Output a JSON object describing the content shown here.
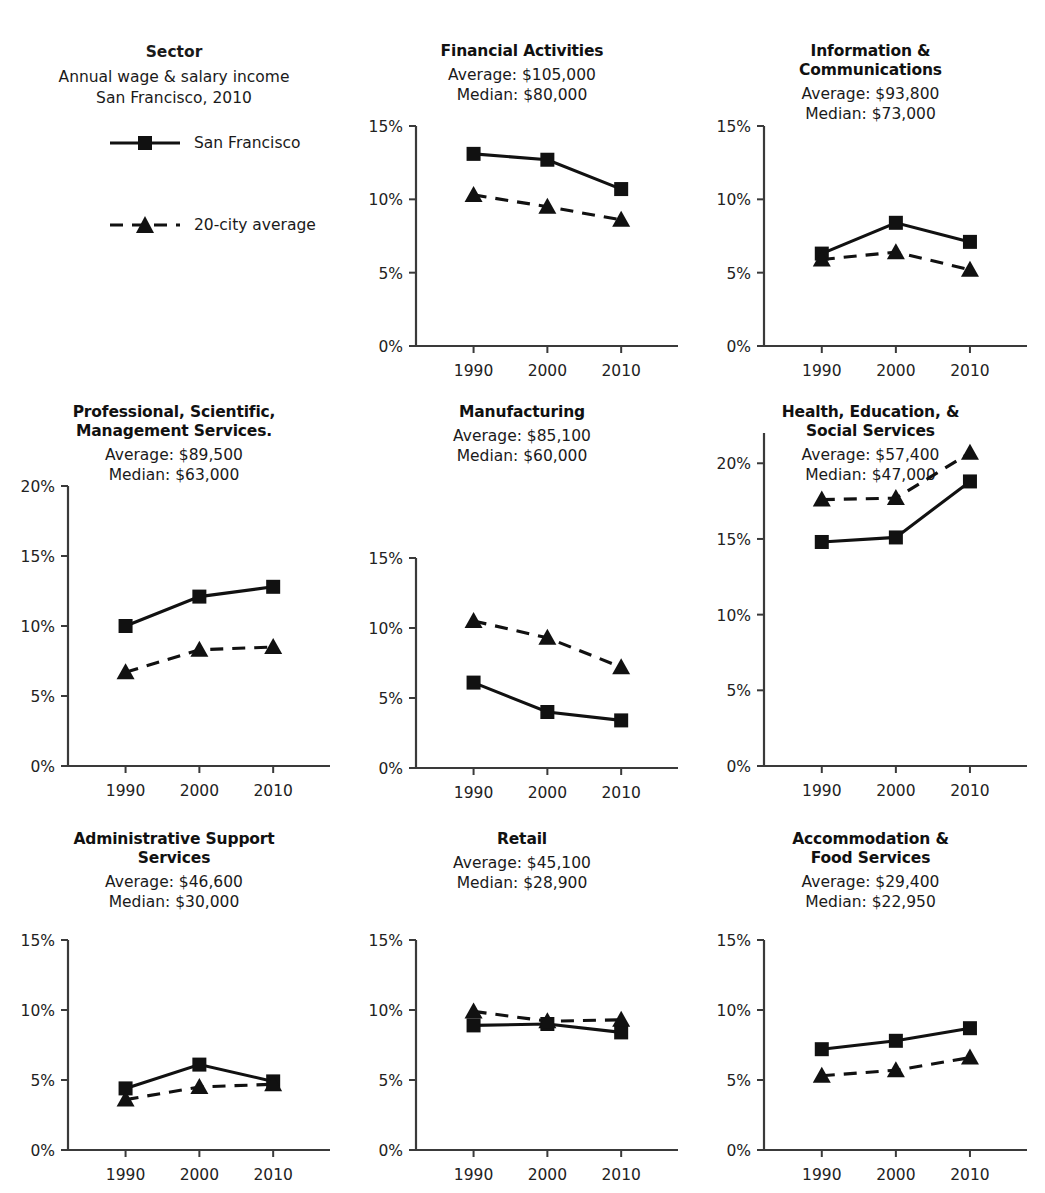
{
  "legend": {
    "title": "Sector",
    "subtitle_line1": "Annual wage & salary income",
    "subtitle_line2": "San Francisco, 2010",
    "items": [
      {
        "label": "San Francisco",
        "key": "solid-square-line-key"
      },
      {
        "label": "20-city average",
        "key": "dashed-triangle-line-key"
      }
    ]
  },
  "chart_data": [
    {
      "type": "line",
      "title": "Financial Activities",
      "average_label": "Average: $105,000",
      "median_label": "Median: $80,000",
      "categories": [
        "1990",
        "2000",
        "2010"
      ],
      "ylim": [
        0,
        15
      ],
      "yticks": [
        0,
        5,
        10,
        15
      ],
      "ytick_labels": [
        "0%",
        "5%",
        "10%",
        "15%"
      ],
      "xlabel": "",
      "ylabel": "",
      "grid": false,
      "series": [
        {
          "name": "San Francisco",
          "values": [
            13.1,
            12.7,
            10.7
          ]
        },
        {
          "name": "20-city average",
          "values": [
            10.3,
            9.5,
            8.6
          ]
        }
      ]
    },
    {
      "type": "line",
      "title": "Information & Communications",
      "average_label": "Average: $93,800",
      "median_label": "Median: $73,000",
      "categories": [
        "1990",
        "2000",
        "2010"
      ],
      "ylim": [
        0,
        15
      ],
      "yticks": [
        0,
        5,
        10,
        15
      ],
      "ytick_labels": [
        "0%",
        "5%",
        "10%",
        "15%"
      ],
      "xlabel": "",
      "ylabel": "",
      "grid": false,
      "series": [
        {
          "name": "San Francisco",
          "values": [
            6.3,
            8.4,
            7.1
          ]
        },
        {
          "name": "20-city average",
          "values": [
            5.9,
            6.4,
            5.2
          ]
        }
      ]
    },
    {
      "type": "line",
      "title": "Professional, Scientific, Management Services.",
      "average_label": "Average: $89,500",
      "median_label": "Median: $63,000",
      "categories": [
        "1990",
        "2000",
        "2010"
      ],
      "ylim": [
        0,
        20
      ],
      "yticks": [
        0,
        5,
        10,
        15,
        20
      ],
      "ytick_labels": [
        "0%",
        "5%",
        "10%",
        "15%",
        "20%"
      ],
      "xlabel": "",
      "ylabel": "",
      "grid": false,
      "series": [
        {
          "name": "San Francisco",
          "values": [
            10.0,
            12.1,
            12.8
          ]
        },
        {
          "name": "20-city average",
          "values": [
            6.7,
            8.3,
            8.5
          ]
        }
      ]
    },
    {
      "type": "line",
      "title": "Manufacturing",
      "average_label": "Average: $85,100",
      "median_label": "Median: $60,000",
      "categories": [
        "1990",
        "2000",
        "2010"
      ],
      "ylim": [
        0,
        15
      ],
      "yticks": [
        0,
        5,
        10,
        15
      ],
      "ytick_labels": [
        "0%",
        "5%",
        "10%",
        "15%"
      ],
      "xlabel": "",
      "ylabel": "",
      "grid": false,
      "series": [
        {
          "name": "San Francisco",
          "values": [
            6.1,
            4.0,
            3.4
          ]
        },
        {
          "name": "20-city average",
          "values": [
            10.5,
            9.3,
            7.2
          ]
        }
      ]
    },
    {
      "type": "line",
      "title": "Health, Education, & Social Services",
      "average_label": "Average: $57,400",
      "median_label": "Median: $47,000",
      "categories": [
        "1990",
        "2000",
        "2010"
      ],
      "ylim": [
        0,
        22
      ],
      "yticks": [
        0,
        5,
        10,
        15,
        20
      ],
      "ytick_labels": [
        "0%",
        "5%",
        "10%",
        "15%",
        "20%"
      ],
      "xlabel": "",
      "ylabel": "",
      "grid": false,
      "series": [
        {
          "name": "San Francisco",
          "values": [
            14.8,
            15.1,
            18.8
          ]
        },
        {
          "name": "20-city average",
          "values": [
            17.6,
            17.7,
            20.7
          ]
        }
      ]
    },
    {
      "type": "line",
      "title": "Administrative Support Services",
      "average_label": "Average: $46,600",
      "median_label": "Median: $30,000",
      "categories": [
        "1990",
        "2000",
        "2010"
      ],
      "ylim": [
        0,
        15
      ],
      "yticks": [
        0,
        5,
        10,
        15
      ],
      "ytick_labels": [
        "0%",
        "5%",
        "10%",
        "15%"
      ],
      "xlabel": "",
      "ylabel": "",
      "grid": false,
      "series": [
        {
          "name": "San Francisco",
          "values": [
            4.4,
            6.1,
            4.9
          ]
        },
        {
          "name": "20-city average",
          "values": [
            3.6,
            4.5,
            4.7
          ]
        }
      ]
    },
    {
      "type": "line",
      "title": "Retail",
      "average_label": "Average: $45,100",
      "median_label": "Median: $28,900",
      "categories": [
        "1990",
        "2000",
        "2010"
      ],
      "ylim": [
        0,
        15
      ],
      "yticks": [
        0,
        5,
        10,
        15
      ],
      "ytick_labels": [
        "0%",
        "5%",
        "10%",
        "15%"
      ],
      "xlabel": "",
      "ylabel": "",
      "grid": false,
      "series": [
        {
          "name": "San Francisco",
          "values": [
            8.9,
            9.0,
            8.4
          ]
        },
        {
          "name": "20-city average",
          "values": [
            9.9,
            9.2,
            9.3
          ]
        }
      ]
    },
    {
      "type": "line",
      "title": "Accommodation & Food Services",
      "average_label": "Average: $29,400",
      "median_label": "Median: $22,950",
      "categories": [
        "1990",
        "2000",
        "2010"
      ],
      "ylim": [
        0,
        15
      ],
      "yticks": [
        0,
        5,
        10,
        15
      ],
      "ytick_labels": [
        "0%",
        "5%",
        "10%",
        "15%"
      ],
      "xlabel": "",
      "ylabel": "",
      "grid": false,
      "series": [
        {
          "name": "San Francisco",
          "values": [
            7.2,
            7.8,
            8.7
          ]
        },
        {
          "name": "20-city average",
          "values": [
            5.3,
            5.7,
            6.6
          ]
        }
      ]
    }
  ],
  "panel_titles": {
    "financial": {
      "line1": "Financial Activities"
    },
    "infocomm": {
      "line1": "Information &",
      "line2": "Communications"
    },
    "professional": {
      "line1": "Professional, Scientific,",
      "line2": "Management Services."
    },
    "manufacturing": {
      "line1": "Manufacturing"
    },
    "health": {
      "line1": "Health, Education, &",
      "line2": "Social Services"
    },
    "admin": {
      "line1": "Administrative Support",
      "line2": "Services"
    },
    "retail": {
      "line1": "Retail"
    },
    "accommodation": {
      "line1": "Accommodation &",
      "line2": "Food Services"
    }
  }
}
